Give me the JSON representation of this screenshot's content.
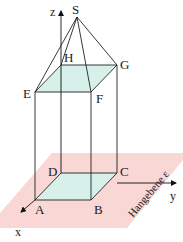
{
  "figure": {
    "type": "3d-geometry-diagram",
    "points": {
      "S": {
        "label": "S",
        "x": 77,
        "y": 17
      },
      "E": {
        "label": "E",
        "x": 35,
        "y": 92
      },
      "F": {
        "label": "F",
        "x": 91,
        "y": 92
      },
      "G": {
        "label": "G",
        "x": 117,
        "y": 65
      },
      "H": {
        "label": "H",
        "x": 61,
        "y": 65
      },
      "A": {
        "label": "A",
        "x": 35,
        "y": 200
      },
      "B": {
        "label": "B",
        "x": 91,
        "y": 200
      },
      "C": {
        "label": "C",
        "x": 117,
        "y": 173
      },
      "D": {
        "label": "D",
        "x": 61,
        "y": 173
      }
    },
    "axes": {
      "x": {
        "label": "x"
      },
      "y": {
        "label": "y"
      },
      "z": {
        "label": "z"
      }
    },
    "plane": {
      "label": "Hangebene ε",
      "color": "#f5c9c6"
    },
    "face_fill_color": "#d8f0ea"
  }
}
